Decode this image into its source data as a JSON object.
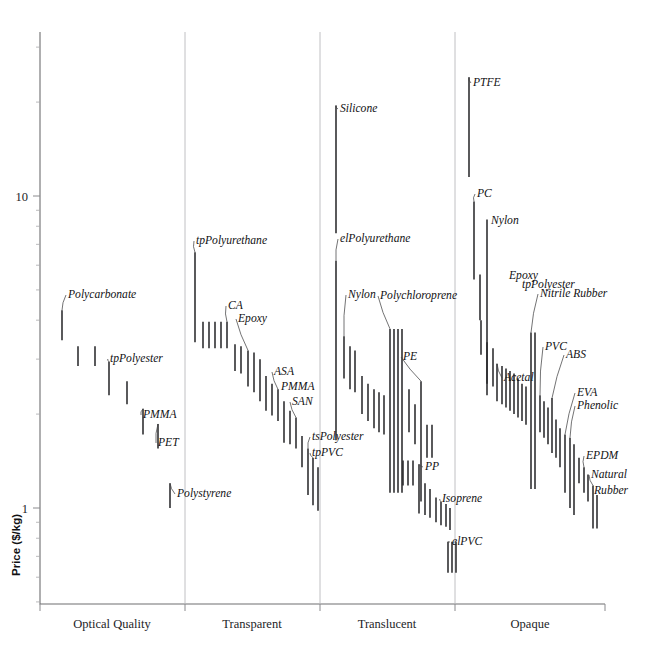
{
  "chart_data": {
    "type": "bar",
    "orientation": "vertical-range",
    "title": "",
    "subtitle": "",
    "xlabel": "",
    "ylabel": "Price ($/kg)",
    "yscale": "log",
    "ylim": [
      0.55,
      30
    ],
    "y_tick_labels": [
      "10",
      "1"
    ],
    "y_tick_values": [
      10,
      1
    ],
    "grid": false,
    "legend": null,
    "legend_position": "none",
    "categories": [
      "Optical Quality",
      "Transparent",
      "Translucent",
      "Opaque"
    ],
    "note": "Each entry is a material with a price range (low-high) in $/kg shown as a vertical bar.",
    "groups": [
      {
        "name": "Optical Quality",
        "x_start": 40,
        "x_end": 185,
        "items": [
          {
            "name": "Polycarbonate",
            "low": 3.45,
            "high": 4.3,
            "x": 62,
            "labeled": true
          },
          {
            "name": "",
            "low": 2.85,
            "high": 3.3,
            "x": 78,
            "labeled": false
          },
          {
            "name": "",
            "low": 2.85,
            "high": 3.3,
            "x": 95,
            "labeled": false
          },
          {
            "name": "tpPolyester",
            "low": 2.3,
            "high": 2.95,
            "x": 109,
            "labeled": true
          },
          {
            "name": "",
            "low": 2.15,
            "high": 2.55,
            "x": 127,
            "labeled": false
          },
          {
            "name": "PMMA",
            "low": 1.72,
            "high": 2.08,
            "x": 143,
            "labeled": true
          },
          {
            "name": "PET",
            "low": 1.55,
            "high": 1.86,
            "x": 158,
            "labeled": true
          }
        ]
      },
      {
        "name": "Transparent",
        "x_start": 185,
        "x_end": 320,
        "items": [
          {
            "name": "tpPolyurethane",
            "low": 3.4,
            "high": 6.6,
            "x": 195,
            "labeled": true
          },
          {
            "name": "",
            "low": 3.25,
            "high": 3.95,
            "x": 203,
            "labeled": false
          },
          {
            "name": "",
            "low": 3.25,
            "high": 3.95,
            "x": 209,
            "labeled": false
          },
          {
            "name": "",
            "low": 3.25,
            "high": 3.95,
            "x": 215,
            "labeled": false
          },
          {
            "name": "",
            "low": 3.25,
            "high": 3.95,
            "x": 221,
            "labeled": false
          },
          {
            "name": "CA",
            "low": 3.25,
            "high": 3.95,
            "x": 227,
            "labeled": true
          },
          {
            "name": "",
            "low": 2.75,
            "high": 3.35,
            "x": 235,
            "labeled": false
          },
          {
            "name": "",
            "low": 2.7,
            "high": 3.3,
            "x": 241,
            "labeled": false
          },
          {
            "name": "Epoxy",
            "low": 2.45,
            "high": 3.2,
            "x": 248,
            "labeled": true
          },
          {
            "name": "",
            "low": 2.35,
            "high": 3.15,
            "x": 254,
            "labeled": false
          },
          {
            "name": "",
            "low": 2.2,
            "high": 3.0,
            "x": 260,
            "labeled": false
          },
          {
            "name": "",
            "low": 2.05,
            "high": 2.65,
            "x": 266,
            "labeled": false
          },
          {
            "name": "",
            "low": 1.98,
            "high": 2.5,
            "x": 272,
            "labeled": false
          },
          {
            "name": "ASA",
            "low": 1.9,
            "high": 2.4,
            "x": 278,
            "labeled": true
          },
          {
            "name": "PMMA",
            "low": 1.62,
            "high": 2.2,
            "x": 284,
            "labeled": true
          },
          {
            "name": "",
            "low": 1.6,
            "high": 2.05,
            "x": 290,
            "labeled": false
          },
          {
            "name": "SAN",
            "low": 1.55,
            "high": 1.95,
            "x": 296,
            "labeled": true
          },
          {
            "name": "",
            "low": 1.35,
            "high": 1.7,
            "x": 302,
            "labeled": false
          },
          {
            "name": "tsPolyester",
            "low": 1.1,
            "high": 1.55,
            "x": 308,
            "labeled": true
          },
          {
            "name": "tpPVC",
            "low": 1.02,
            "high": 1.45,
            "x": 313,
            "labeled": true
          },
          {
            "name": "",
            "low": 0.98,
            "high": 1.35,
            "x": 318,
            "labeled": false
          },
          {
            "name": "Polystyrene",
            "low": 1.0,
            "high": 1.2,
            "x": 170,
            "labeled": true
          }
        ]
      },
      {
        "name": "Translucent",
        "x_start": 320,
        "x_end": 455,
        "items": [
          {
            "name": "Silicone",
            "low": 7.6,
            "high": 19.5,
            "x": 336,
            "labeled": true
          },
          {
            "name": "elPolyurethane",
            "low": 1.65,
            "high": 6.2,
            "x": 336,
            "labeled": true
          },
          {
            "name": "Nylon",
            "low": 2.6,
            "high": 3.55,
            "x": 344,
            "labeled": true
          },
          {
            "name": "",
            "low": 2.4,
            "high": 3.3,
            "x": 350,
            "labeled": false
          },
          {
            "name": "",
            "low": 2.35,
            "high": 3.2,
            "x": 355,
            "labeled": false
          },
          {
            "name": "",
            "low": 2.0,
            "high": 2.65,
            "x": 362,
            "labeled": false
          },
          {
            "name": "",
            "low": 1.9,
            "high": 2.5,
            "x": 368,
            "labeled": false
          },
          {
            "name": "",
            "low": 1.8,
            "high": 2.4,
            "x": 374,
            "labeled": false
          },
          {
            "name": "",
            "low": 1.75,
            "high": 2.35,
            "x": 379,
            "labeled": false
          },
          {
            "name": "",
            "low": 1.72,
            "high": 2.3,
            "x": 384,
            "labeled": false
          },
          {
            "name": "Polychloroprene",
            "low": 1.12,
            "high": 3.75,
            "x": 390,
            "labeled": true
          },
          {
            "name": "",
            "low": 1.12,
            "high": 3.75,
            "x": 394,
            "labeled": false
          },
          {
            "name": "",
            "low": 1.12,
            "high": 3.75,
            "x": 398,
            "labeled": false
          },
          {
            "name": "",
            "low": 1.12,
            "high": 3.75,
            "x": 402,
            "labeled": false
          },
          {
            "name": "",
            "low": 1.75,
            "high": 2.4,
            "x": 409,
            "labeled": false
          },
          {
            "name": "",
            "low": 1.6,
            "high": 2.15,
            "x": 415,
            "labeled": false
          },
          {
            "name": "PE",
            "low": 1.05,
            "high": 2.55,
            "x": 421,
            "labeled": true
          },
          {
            "name": "",
            "low": 1.45,
            "high": 1.85,
            "x": 427,
            "labeled": false
          },
          {
            "name": "",
            "low": 1.45,
            "high": 1.85,
            "x": 432,
            "labeled": false
          },
          {
            "name": "",
            "low": 1.18,
            "high": 1.42,
            "x": 403,
            "labeled": false
          },
          {
            "name": "",
            "low": 1.18,
            "high": 1.42,
            "x": 408,
            "labeled": false
          },
          {
            "name": "",
            "low": 1.18,
            "high": 1.42,
            "x": 413,
            "labeled": false
          },
          {
            "name": "PP",
            "low": 0.96,
            "high": 1.38,
            "x": 419,
            "labeled": true
          },
          {
            "name": "",
            "low": 0.95,
            "high": 1.2,
            "x": 425,
            "labeled": false
          },
          {
            "name": "",
            "low": 0.93,
            "high": 1.15,
            "x": 430,
            "labeled": false
          },
          {
            "name": "",
            "low": 0.9,
            "high": 1.08,
            "x": 436,
            "labeled": false
          },
          {
            "name": "Isoprene",
            "low": 0.88,
            "high": 1.05,
            "x": 441,
            "labeled": true
          },
          {
            "name": "",
            "low": 0.87,
            "high": 1.03,
            "x": 446,
            "labeled": false
          },
          {
            "name": "",
            "low": 0.85,
            "high": 1.0,
            "x": 450,
            "labeled": false
          },
          {
            "name": "elPVC",
            "low": 0.62,
            "high": 0.78,
            "x": 448,
            "labeled": true
          },
          {
            "name": "",
            "low": 0.62,
            "high": 0.78,
            "x": 452,
            "labeled": false
          },
          {
            "name": "",
            "low": 0.62,
            "high": 0.78,
            "x": 456,
            "labeled": false
          }
        ]
      },
      {
        "name": "Opaque",
        "x_start": 455,
        "x_end": 605,
        "items": [
          {
            "name": "PTFE",
            "low": 11.5,
            "high": 24.0,
            "x": 469,
            "labeled": true
          },
          {
            "name": "PC",
            "low": 5.4,
            "high": 9.6,
            "x": 474,
            "labeled": true
          },
          {
            "name": "",
            "low": 4.0,
            "high": 5.6,
            "x": 480,
            "labeled": false
          },
          {
            "name": "Nylon",
            "low": 2.3,
            "high": 8.4,
            "x": 487,
            "labeled": true
          },
          {
            "name": "",
            "low": 3.1,
            "high": 4.0,
            "x": 481,
            "labeled": false
          },
          {
            "name": "",
            "low": 2.5,
            "high": 3.4,
            "x": 487,
            "labeled": false
          },
          {
            "name": "",
            "low": 2.45,
            "high": 3.25,
            "x": 493,
            "labeled": false
          },
          {
            "name": "Acetal",
            "low": 2.2,
            "high": 2.9,
            "x": 497,
            "labeled": true
          },
          {
            "name": "Epoxy",
            "low": 2.15,
            "high": 2.85,
            "x": 502,
            "labeled": true
          },
          {
            "name": "",
            "low": 2.1,
            "high": 2.8,
            "x": 506,
            "labeled": false
          },
          {
            "name": "",
            "low": 2.05,
            "high": 2.75,
            "x": 510,
            "labeled": false
          },
          {
            "name": "tpPolyester",
            "low": 2.0,
            "high": 2.7,
            "x": 514,
            "labeled": true
          },
          {
            "name": "",
            "low": 1.95,
            "high": 2.6,
            "x": 518,
            "labeled": false
          },
          {
            "name": "",
            "low": 1.9,
            "high": 2.5,
            "x": 522,
            "labeled": false
          },
          {
            "name": "",
            "low": 1.85,
            "high": 2.45,
            "x": 526,
            "labeled": false
          },
          {
            "name": "Nitrile Rubber",
            "low": 1.15,
            "high": 3.65,
            "x": 531,
            "labeled": true
          },
          {
            "name": "",
            "low": 1.15,
            "high": 3.65,
            "x": 535,
            "labeled": false
          },
          {
            "name": "PVC",
            "low": 1.75,
            "high": 2.3,
            "x": 540,
            "labeled": true
          },
          {
            "name": "",
            "low": 1.68,
            "high": 2.2,
            "x": 544,
            "labeled": false
          },
          {
            "name": "",
            "low": 1.6,
            "high": 2.1,
            "x": 548,
            "labeled": false
          },
          {
            "name": "ABS",
            "low": 1.5,
            "high": 2.25,
            "x": 552,
            "labeled": true
          },
          {
            "name": "",
            "low": 1.45,
            "high": 1.92,
            "x": 556,
            "labeled": false
          },
          {
            "name": "",
            "low": 1.35,
            "high": 1.8,
            "x": 560,
            "labeled": false
          },
          {
            "name": "EVA",
            "low": 1.12,
            "high": 1.72,
            "x": 565,
            "labeled": true
          },
          {
            "name": "Phenolic",
            "low": 1.0,
            "high": 1.68,
            "x": 570,
            "labeled": true
          },
          {
            "name": "",
            "low": 0.95,
            "high": 1.6,
            "x": 574,
            "labeled": false
          },
          {
            "name": "",
            "low": 1.2,
            "high": 1.45,
            "x": 579,
            "labeled": false
          },
          {
            "name": "EPDM",
            "low": 1.12,
            "high": 1.35,
            "x": 584,
            "labeled": true
          },
          {
            "name": "",
            "low": 1.05,
            "high": 1.28,
            "x": 588,
            "labeled": false
          },
          {
            "name": "Natural Rubber",
            "low": 0.86,
            "high": 1.18,
            "x": 593,
            "labeled": true
          },
          {
            "name": "",
            "low": 0.86,
            "high": 1.1,
            "x": 597,
            "labeled": false
          }
        ]
      }
    ],
    "annotations": [
      {
        "text": "Polycarbonate",
        "x": 68,
        "y": 298
      },
      {
        "text": "tpPolyester",
        "x": 110,
        "y": 362
      },
      {
        "text": "PMMA",
        "x": 143,
        "y": 418
      },
      {
        "text": "PET",
        "x": 158,
        "y": 446
      },
      {
        "text": "tpPolyurethane",
        "x": 196,
        "y": 244
      },
      {
        "text": "CA",
        "x": 228,
        "y": 309
      },
      {
        "text": "Epoxy",
        "x": 238,
        "y": 322
      },
      {
        "text": "ASA",
        "x": 274,
        "y": 375
      },
      {
        "text": "PMMA",
        "x": 281,
        "y": 390
      },
      {
        "text": "SAN",
        "x": 292,
        "y": 405
      },
      {
        "text": "tsPolyester",
        "x": 312,
        "y": 440
      },
      {
        "text": "tpPVC",
        "x": 312,
        "y": 456
      },
      {
        "text": "Polystyrene",
        "x": 177,
        "y": 497
      },
      {
        "text": "Silicone",
        "x": 340,
        "y": 112
      },
      {
        "text": "elPolyurethane",
        "x": 340,
        "y": 242
      },
      {
        "text": "Nylon",
        "x": 348,
        "y": 298
      },
      {
        "text": "Polychloroprene",
        "x": 380,
        "y": 299
      },
      {
        "text": "PE",
        "x": 403,
        "y": 360
      },
      {
        "text": "PP",
        "x": 425,
        "y": 470
      },
      {
        "text": "Isoprene",
        "x": 442,
        "y": 502
      },
      {
        "text": "elPVC",
        "x": 452,
        "y": 545
      },
      {
        "text": "PTFE",
        "x": 473,
        "y": 86
      },
      {
        "text": "PC",
        "x": 477,
        "y": 197
      },
      {
        "text": "Nylon",
        "x": 491,
        "y": 224
      },
      {
        "text": "Epoxy",
        "x": 509,
        "y": 279
      },
      {
        "text": "tpPolyester",
        "x": 522,
        "y": 288
      },
      {
        "text": "Nitrile Rubber",
        "x": 540,
        "y": 297
      },
      {
        "text": "Acetal",
        "x": 504,
        "y": 381
      },
      {
        "text": "PVC",
        "x": 545,
        "y": 350
      },
      {
        "text": "ABS",
        "x": 566,
        "y": 358
      },
      {
        "text": "EVA",
        "x": 577,
        "y": 396
      },
      {
        "text": "Phenolic",
        "x": 577,
        "y": 409
      },
      {
        "text": "EPDM",
        "x": 586,
        "y": 459
      },
      {
        "text": "Natural",
        "x": 591,
        "y": 478
      },
      {
        "text": "Rubber",
        "x": 594,
        "y": 494
      }
    ]
  },
  "axes": {
    "y_title": "Price ($/kg)",
    "y_labels": [
      {
        "text": "10",
        "value": 10
      },
      {
        "text": "1",
        "value": 1
      }
    ],
    "x_categories": [
      {
        "label": "Optical Quality",
        "center": 112
      },
      {
        "label": "Transparent",
        "center": 252
      },
      {
        "label": "Translucent",
        "center": 387
      },
      {
        "label": "Opaque",
        "center": 530
      }
    ]
  }
}
